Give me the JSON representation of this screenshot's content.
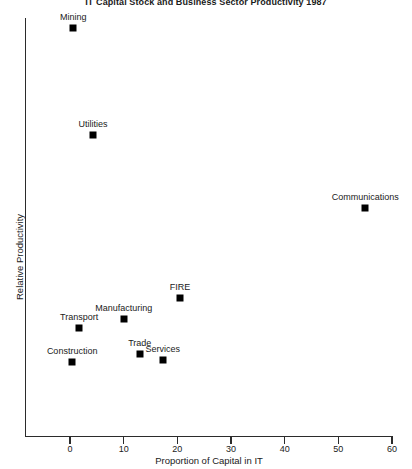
{
  "chart_data": {
    "type": "scatter",
    "title": "IT Capital Stock and Business Sector Productivity 1987",
    "xlabel": "Proportion of Capital in IT",
    "ylabel": "Relative Productivity",
    "xlim": [
      0,
      60
    ],
    "xticks": [
      0,
      10,
      20,
      30,
      40,
      50,
      60
    ],
    "xtick_labels": [
      "0",
      "10",
      "20",
      "30",
      "40",
      "50",
      "60"
    ],
    "ylim": [
      0,
      100
    ],
    "yticks": [],
    "ytick_labels": [],
    "grid": false,
    "legend": false,
    "marker": "filled-square",
    "marker_color": "#000000",
    "points": [
      {
        "label": "Mining",
        "x": 0.6,
        "y": 96.5
      },
      {
        "label": "Utilities",
        "x": 4.3,
        "y": 71.5
      },
      {
        "label": "Communications",
        "x": 55.0,
        "y": 54.5
      },
      {
        "label": "FIRE",
        "x": 20.5,
        "y": 33.5
      },
      {
        "label": "Manufacturing",
        "x": 10.0,
        "y": 28.8
      },
      {
        "label": "Transport",
        "x": 1.7,
        "y": 26.6
      },
      {
        "label": "Trade",
        "x": 13.0,
        "y": 20.6
      },
      {
        "label": "Services",
        "x": 17.3,
        "y": 19.2
      },
      {
        "label": "Construction",
        "x": 0.4,
        "y": 18.7
      }
    ]
  }
}
